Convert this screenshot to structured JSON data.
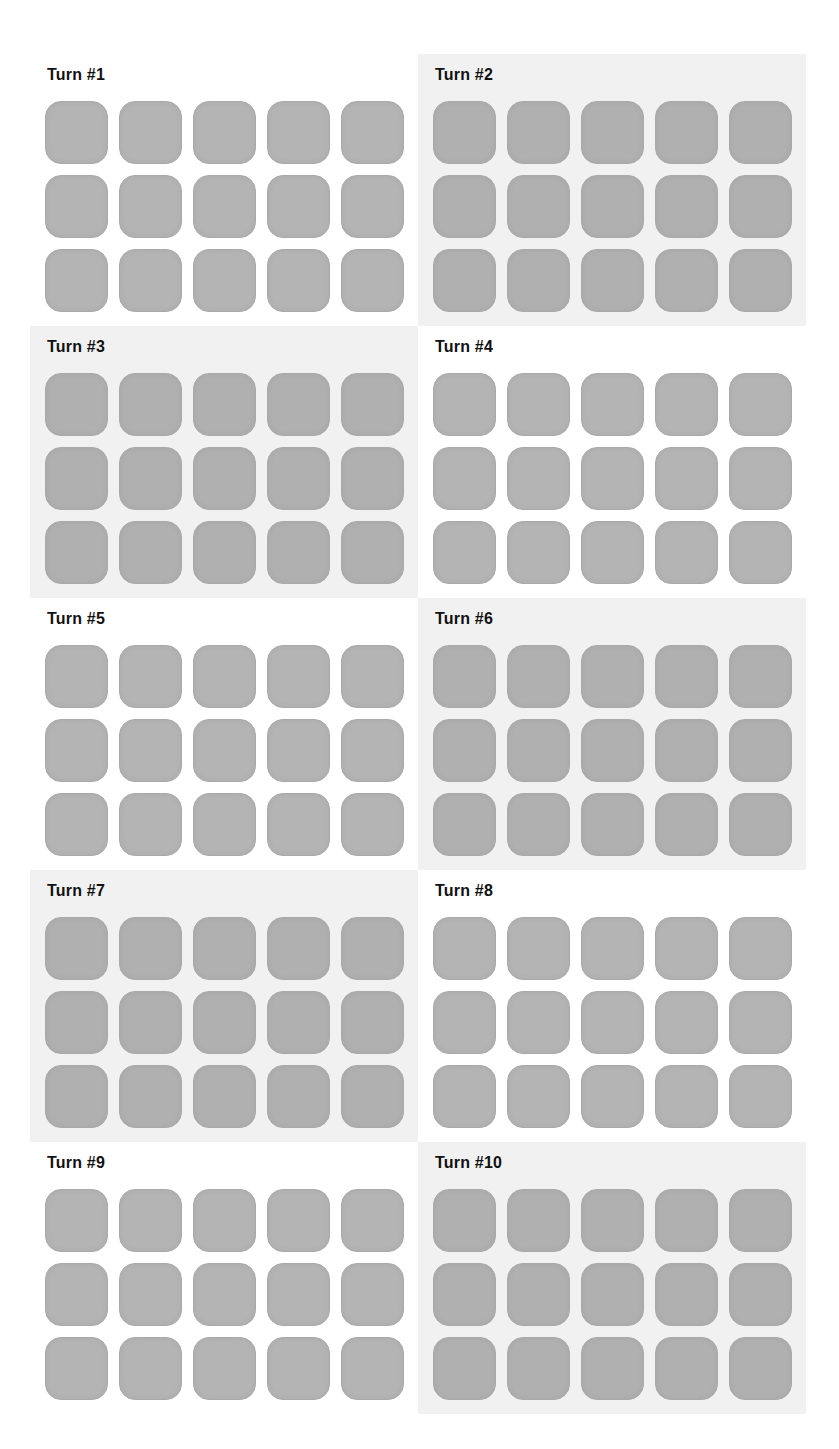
{
  "game": {
    "tile_color": "#b4b4b4",
    "shaded_panel_color": "#f1f1f1",
    "grid": {
      "rows": 3,
      "columns": 5
    }
  },
  "turns": [
    {
      "label": "Turn #1",
      "shaded": false
    },
    {
      "label": "Turn #2",
      "shaded": true
    },
    {
      "label": "Turn #3",
      "shaded": true
    },
    {
      "label": "Turn #4",
      "shaded": false
    },
    {
      "label": "Turn #5",
      "shaded": false
    },
    {
      "label": "Turn #6",
      "shaded": true
    },
    {
      "label": "Turn #7",
      "shaded": true
    },
    {
      "label": "Turn #8",
      "shaded": false
    },
    {
      "label": "Turn #9",
      "shaded": false
    },
    {
      "label": "Turn #10",
      "shaded": true
    }
  ]
}
